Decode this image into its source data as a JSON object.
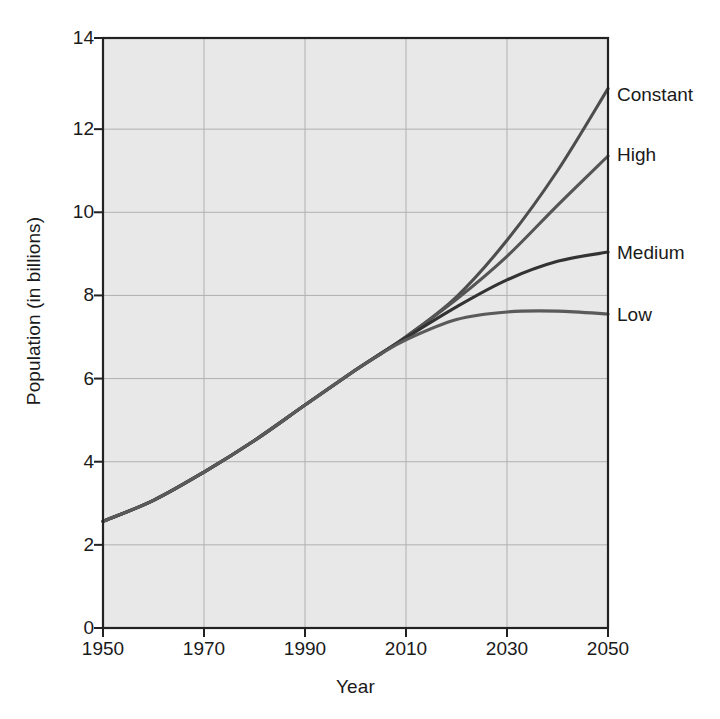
{
  "chart_data": {
    "type": "line",
    "title": "",
    "xlabel": "Year",
    "ylabel": "Population (in billions)",
    "xlim": [
      1950,
      2050
    ],
    "ylim": [
      0,
      14
    ],
    "xticks": [
      1950,
      1970,
      1990,
      2010,
      2030,
      2050
    ],
    "yticks": [
      0,
      2,
      4,
      6,
      8,
      10,
      12,
      14
    ],
    "grid": true,
    "legend_position": "right-of-axes-inline",
    "x": [
      1950,
      1960,
      1970,
      1980,
      1990,
      2000,
      2005,
      2010,
      2020,
      2030,
      2040,
      2050
    ],
    "series": [
      {
        "name": "Constant",
        "label": "Constant",
        "color": "#4d4d4d",
        "values": [
          2.53,
          3.03,
          3.7,
          4.45,
          5.29,
          6.12,
          6.51,
          6.91,
          7.86,
          9.2,
          10.85,
          12.8
        ]
      },
      {
        "name": "High",
        "label": "High",
        "color": "#555555",
        "values": [
          2.53,
          3.03,
          3.7,
          4.45,
          5.29,
          6.12,
          6.51,
          6.91,
          7.8,
          8.82,
          10.03,
          11.2
        ]
      },
      {
        "name": "Medium",
        "label": "Medium",
        "color": "#333333",
        "values": [
          2.53,
          3.03,
          3.7,
          4.45,
          5.29,
          6.12,
          6.51,
          6.89,
          7.62,
          8.26,
          8.7,
          8.92
        ]
      },
      {
        "name": "Low",
        "label": "Low",
        "color": "#5a5a5a",
        "values": [
          2.53,
          3.03,
          3.7,
          4.45,
          5.29,
          6.12,
          6.5,
          6.84,
          7.32,
          7.5,
          7.52,
          7.45
        ]
      }
    ],
    "colors": {
      "plot_background": "#e8e8e8",
      "axis_line": "#222222",
      "gridline": "#b4b4b4",
      "text": "#1a1a1a",
      "page_background": "#ffffff"
    }
  },
  "axis": {
    "ytick_labels": [
      "14",
      "12",
      "10",
      "8",
      "6",
      "4",
      "2",
      "0"
    ],
    "xtick_labels": [
      "1950",
      "1970",
      "1990",
      "2010",
      "2030",
      "2050"
    ],
    "ylabel": "Population (in billions)",
    "xlabel": "Year"
  },
  "series_labels": [
    "Constant",
    "High",
    "Medium",
    "Low"
  ]
}
